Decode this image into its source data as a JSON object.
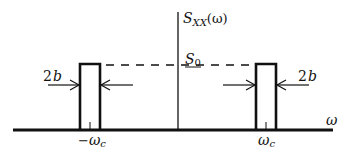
{
  "diagram": {
    "y_axis_label": "S_XX(ω)",
    "y_axis_label_main": "S",
    "y_axis_label_sub": "XX",
    "y_axis_label_arg": "(ω)",
    "x_axis_label": "ω",
    "level_label_main": "S",
    "level_label_sub": "0",
    "left_center_label_sign": "−",
    "left_center_label_main": "ω",
    "left_center_label_sub": "c",
    "right_center_label_main": "ω",
    "right_center_label_sub": "c",
    "left_width_label": "2b",
    "left_width_num": "2",
    "left_width_var": "b",
    "right_width_label": "2b",
    "right_width_num": "2",
    "right_width_var": "b",
    "pulses": [
      {
        "center": "-ωc",
        "width": "2b",
        "height": "S0"
      },
      {
        "center": "ωc",
        "width": "2b",
        "height": "S0"
      }
    ],
    "colors": {
      "stroke": "#111111",
      "background": "#ffffff"
    }
  }
}
